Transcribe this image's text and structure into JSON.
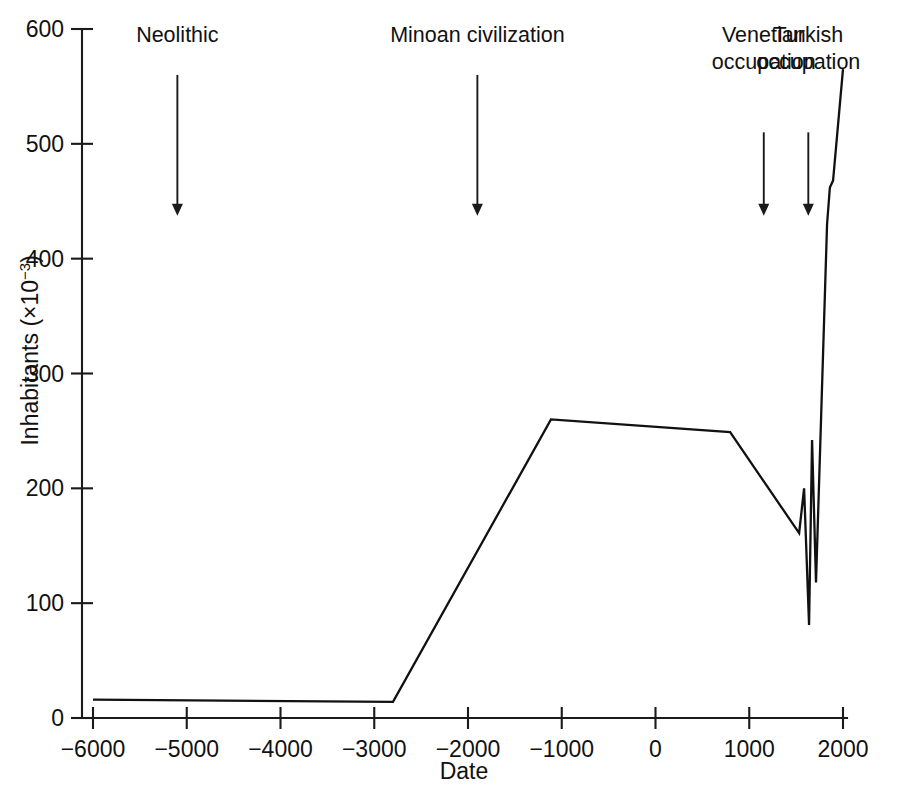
{
  "chart_data": {
    "type": "line",
    "title": "",
    "xlabel": "Date",
    "ylabel": "Inhabitants (×10⁻³)",
    "ylabel_plain": "Inhabitants",
    "ylabel_exponent_prefix": "(×10",
    "ylabel_exponent": "−3",
    "ylabel_suffix": ")",
    "xlim": [
      -6000,
      2000
    ],
    "ylim": [
      0,
      600
    ],
    "xticks": [
      -6000,
      -5000,
      -4000,
      -3000,
      -2000,
      -1000,
      0,
      1000,
      2000
    ],
    "xticklabels": [
      "−6000",
      "−5000",
      "−4000",
      "−3000",
      "−2000",
      "−1000",
      "0",
      "1000",
      "2000"
    ],
    "yticks": [
      0,
      100,
      200,
      300,
      400,
      500,
      600
    ],
    "yticklabels": [
      "0",
      "100",
      "200",
      "300",
      "400",
      "500",
      "600"
    ],
    "grid": false,
    "legend": false,
    "line_color": "#111111",
    "series": [
      {
        "name": "Population of Crete",
        "x": [
          -6000,
          -2800,
          -1115,
          796,
          1532,
          1585,
          1638,
          1670,
          1712,
          1830,
          1860,
          1894,
          2000
        ],
        "y": [
          16,
          14,
          260,
          249,
          161,
          200,
          81,
          242,
          118,
          430,
          462,
          468,
          565
        ]
      }
    ],
    "annotations": [
      {
        "label": "Neolithic",
        "lines": [
          "Neolithic"
        ],
        "x": -5100,
        "arrow_from_y": 560,
        "arrow_to_y": 440
      },
      {
        "label": "Minoan civilization",
        "lines": [
          "Minoan civilization"
        ],
        "x": -1900,
        "arrow_from_y": 560,
        "arrow_to_y": 440
      },
      {
        "label": "Venetian occupation",
        "lines": [
          "Venetian",
          "occupation"
        ],
        "x": 1155,
        "arrow_from_y": 510,
        "arrow_to_y": 440
      },
      {
        "label": "Turkish occupation",
        "lines": [
          "Turkish",
          "occupation"
        ],
        "x": 1630,
        "arrow_from_y": 510,
        "arrow_to_y": 440
      }
    ]
  },
  "figure": {
    "caption": "",
    "background_color": "#ffffff"
  }
}
